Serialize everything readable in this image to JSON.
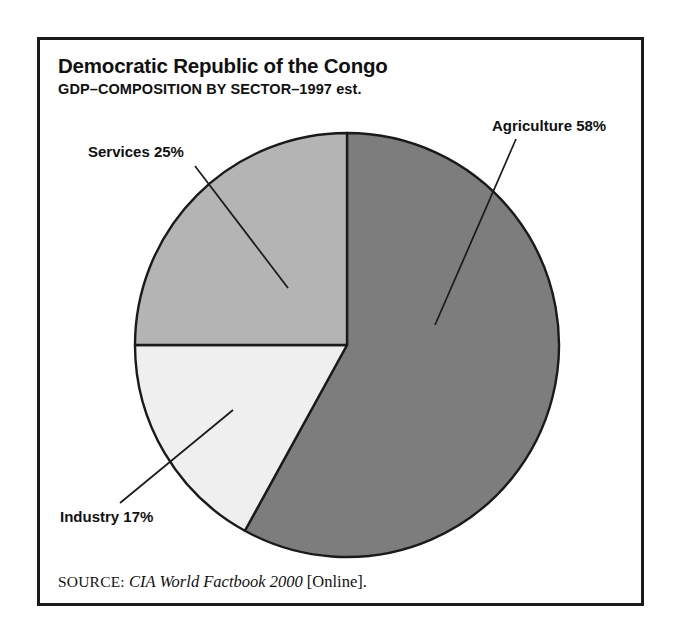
{
  "figure": {
    "title": "Democratic Republic of the Congo",
    "subtitle": "GDP–COMPOSITION BY SECTOR–1997 est.",
    "frame_color": "#1a1a1a",
    "background": "#ffffff"
  },
  "labels": {
    "agriculture": "Agriculture 58%",
    "services": "Services 25%",
    "industry": "Industry 17%"
  },
  "source": {
    "label": "SOURCE:",
    "title": "CIA World Factbook 2000",
    "medium": "[Online]."
  },
  "chart_data": {
    "type": "pie",
    "title": "Democratic Republic of the Congo",
    "subtitle": "GDP–COMPOSITION BY SECTOR–1997 est.",
    "xlabel": "",
    "ylabel": "",
    "unit": "percent",
    "total": 100,
    "start_angle_deg": 0,
    "direction": "clockwise",
    "legend": "none (direct labels with leader lines)",
    "grid": false,
    "categories": [
      "Agriculture",
      "Industry",
      "Services"
    ],
    "values": [
      58,
      17,
      25
    ],
    "slices": [
      {
        "name": "Agriculture",
        "value": 58,
        "label": "Agriculture 58%",
        "color": "#7d7d7d",
        "start_deg": 0,
        "end_deg": 208.8,
        "label_position": "right"
      },
      {
        "name": "Industry",
        "value": 17,
        "label": "Industry 17%",
        "color": "#efefef",
        "start_deg": 208.8,
        "end_deg": 270,
        "label_position": "bottom-left"
      },
      {
        "name": "Services",
        "value": 25,
        "label": "Services 25%",
        "color": "#b4b4b4",
        "start_deg": 270,
        "end_deg": 360,
        "label_position": "top-left"
      }
    ],
    "annotations": [
      "SOURCE: CIA World Factbook 2000 [Online]."
    ]
  }
}
